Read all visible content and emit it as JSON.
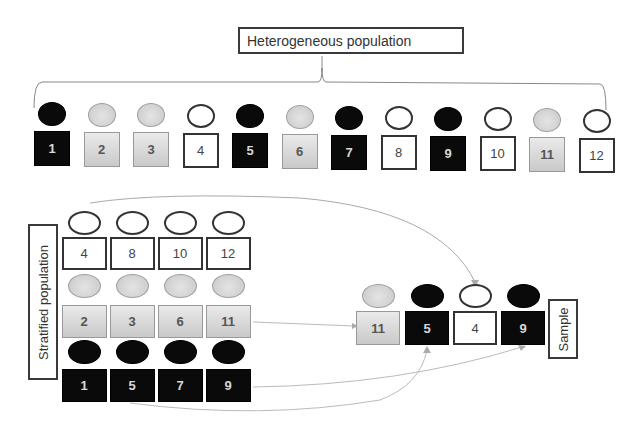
{
  "title": "Heterogeneous population",
  "stratified_label": "Stratified population",
  "sample_label": "Sample",
  "colors": {
    "black": "#0a0a0a",
    "gray": "#d0d0d0",
    "white": "#ffffff"
  },
  "population": [
    {
      "id": "1",
      "stratum": "black"
    },
    {
      "id": "2",
      "stratum": "gray"
    },
    {
      "id": "3",
      "stratum": "gray"
    },
    {
      "id": "4",
      "stratum": "white"
    },
    {
      "id": "5",
      "stratum": "black"
    },
    {
      "id": "6",
      "stratum": "gray"
    },
    {
      "id": "7",
      "stratum": "black"
    },
    {
      "id": "8",
      "stratum": "white"
    },
    {
      "id": "9",
      "stratum": "black"
    },
    {
      "id": "10",
      "stratum": "white"
    },
    {
      "id": "11",
      "stratum": "gray"
    },
    {
      "id": "12",
      "stratum": "white"
    }
  ],
  "strata": [
    {
      "name": "white",
      "members": [
        "4",
        "8",
        "10",
        "12"
      ]
    },
    {
      "name": "gray",
      "members": [
        "2",
        "3",
        "6",
        "11"
      ]
    },
    {
      "name": "black",
      "members": [
        "1",
        "5",
        "7",
        "9"
      ]
    }
  ],
  "sample": [
    {
      "id": "11",
      "stratum": "gray"
    },
    {
      "id": "5",
      "stratum": "black"
    },
    {
      "id": "4",
      "stratum": "white"
    },
    {
      "id": "9",
      "stratum": "black"
    }
  ]
}
